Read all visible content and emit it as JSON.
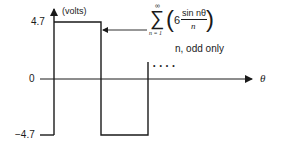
{
  "figure": {
    "y_axis_unit": "(volts)",
    "y_ticks": [
      "4.7",
      "0",
      "−4.7"
    ],
    "x_axis_label": "θ",
    "continuation": "• • • •",
    "formula": {
      "sum_symbol": "∑",
      "upper_limit": "∞",
      "lower_limit": "n = 1",
      "coefficient": "6",
      "numerator": "sin nθ",
      "denominator": "n",
      "condition": "n, odd only"
    },
    "waveform": {
      "type": "square wave",
      "high": 4.7,
      "low": -4.7,
      "colors": {
        "line": "#1a1a1a",
        "background": "#ffffff"
      }
    }
  }
}
